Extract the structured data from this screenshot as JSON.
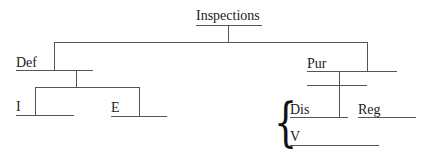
{
  "diagram": {
    "type": "tree",
    "root": {
      "label": "Inspections",
      "children": [
        {
          "label": "Def",
          "children": [
            {
              "label": "I",
              "children": []
            },
            {
              "label": "E",
              "children": []
            }
          ]
        },
        {
          "label": "Pur",
          "children": [
            {
              "group": "brace",
              "items": [
                {
                  "label": "Dis"
                },
                {
                  "label": "V"
                }
              ]
            },
            {
              "label": "Reg",
              "children": []
            }
          ]
        }
      ]
    },
    "labels": {
      "root": "Inspections",
      "def": "Def",
      "i": "I",
      "e": "E",
      "pur": "Pur",
      "dis": "Dis",
      "reg": "Reg",
      "v": "V"
    },
    "brace_glyph": "{",
    "line_color": "#555555"
  }
}
